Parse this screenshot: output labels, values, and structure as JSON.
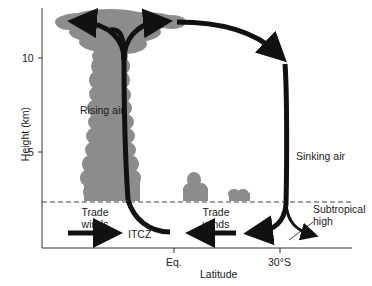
{
  "figure": {
    "type": "diagram",
    "title": "",
    "axes": {
      "y_label": "Height (km)",
      "y_ticks": [
        {
          "value": 10,
          "label": "10"
        },
        {
          "value": 5,
          "label": "5"
        }
      ],
      "x_label": "Latitude",
      "x_ticks": [
        {
          "position": "equator",
          "label": "Eq."
        },
        {
          "position": "30S",
          "label": "30°S"
        }
      ]
    },
    "labels": {
      "rising_air": "Rising air",
      "sinking_air": "Sinking air",
      "trade_winds_left_1": "Trade",
      "trade_winds_left_2": "winds",
      "trade_winds_right_1": "Trade",
      "trade_winds_right_2": "winds",
      "itcz": "ITCZ",
      "subtropical_high_1": "Subtropical",
      "subtropical_high_2": "high"
    },
    "colors": {
      "cloud": "#8c8c8c",
      "arrow": "#111111",
      "axis": "#333333",
      "dashed": "#444444",
      "background": "#ffffff"
    }
  }
}
